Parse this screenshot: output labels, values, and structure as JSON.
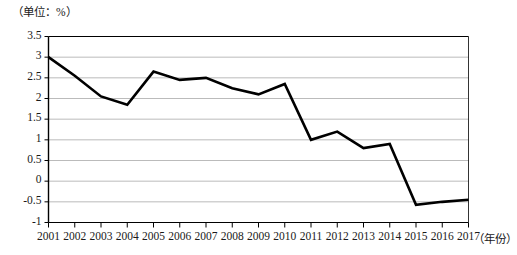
{
  "chart_data": {
    "type": "line",
    "title": "",
    "subtitle": "",
    "unit_label": "（单位：%）",
    "xlabel": "（年份）",
    "ylabel": "",
    "categories": [
      "2001",
      "2002",
      "2003",
      "2004",
      "2005",
      "2006",
      "2007",
      "2008",
      "2009",
      "2010",
      "2011",
      "2012",
      "2013",
      "2014",
      "2015",
      "2016",
      "2017"
    ],
    "values": [
      3.0,
      2.55,
      2.05,
      1.85,
      2.65,
      2.45,
      2.5,
      2.25,
      2.1,
      2.35,
      1.0,
      1.2,
      0.8,
      0.9,
      -0.57,
      -0.5,
      -0.45
    ],
    "ylim": [
      -1,
      3.5
    ],
    "yticks": [
      "3.5",
      "3",
      "2.5",
      "2",
      "1.5",
      "1",
      "0.5",
      "0",
      "-0.5",
      "-1"
    ],
    "ytick_values": [
      3.5,
      3,
      2.5,
      2,
      1.5,
      1,
      0.5,
      0,
      -0.5,
      -1
    ],
    "grid": true,
    "legend": "none",
    "series_color": "#000000",
    "grid_color": "#a9a9a9",
    "axis_color": "#000000"
  }
}
